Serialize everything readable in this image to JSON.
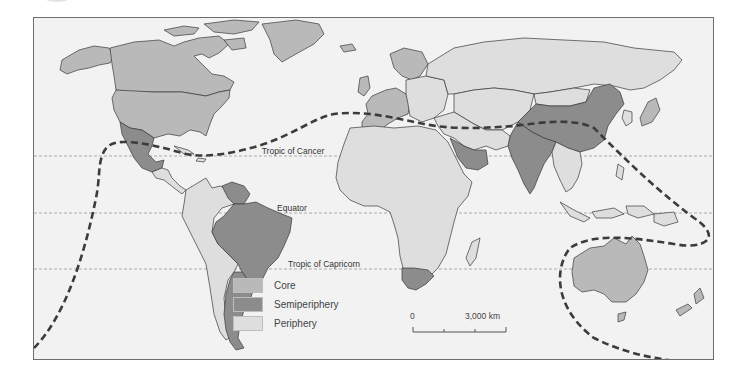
{
  "map": {
    "type": "world-systems choropleth",
    "latitude_lines": [
      {
        "name": "tropic_of_cancer",
        "label": "Tropic of Cancer"
      },
      {
        "name": "equator",
        "label": "Equator"
      },
      {
        "name": "tropic_of_capricorn",
        "label": "Tropic of Capricorn"
      }
    ],
    "colors": {
      "ocean": "#f2f2f2",
      "core": "#b9b9b9",
      "semiperiphery": "#8c8c8c",
      "periphery": "#dedede",
      "border": "#3a3a3a",
      "dashed_boundary": "#3c3c3c",
      "latitude_line": "#9a9a9a"
    },
    "legend": {
      "items": [
        {
          "label": "Core",
          "color": "#b9b9b9"
        },
        {
          "label": "Semiperiphery",
          "color": "#8c8c8c"
        },
        {
          "label": "Periphery",
          "color": "#dedede"
        }
      ]
    },
    "scale": {
      "start_label": "0",
      "end_label": "3,000 km"
    }
  }
}
